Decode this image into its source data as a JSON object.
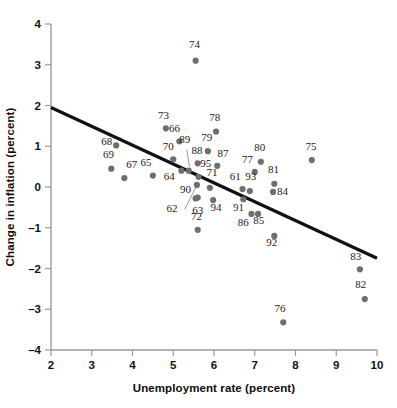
{
  "chart_data": {
    "type": "scatter",
    "title": "",
    "xlabel": "Unemployment rate (percent)",
    "ylabel": "Change in inflation (percent)",
    "xlim": [
      2,
      10
    ],
    "ylim": [
      -4,
      4
    ],
    "xticks": [
      "2",
      "3",
      "4",
      "5",
      "6",
      "7",
      "8",
      "9",
      "10"
    ],
    "yticks": [
      "4",
      "3",
      "2",
      "1",
      "0",
      "-1",
      "-2",
      "-3",
      "-4"
    ],
    "grid": false,
    "legend": null,
    "point_color": "#6e6e6e",
    "line_color": "#111111",
    "fit_line": {
      "label": "regression line",
      "x_start": 2.0,
      "y_start": 1.95,
      "x_end": 10.0,
      "y_end": -1.75
    },
    "points": [
      {
        "label": "61",
        "x": 6.7,
        "y": -0.05,
        "lx": 6.52,
        "ly": 0.18
      },
      {
        "label": "62",
        "x": 5.55,
        "y": -0.28,
        "lx": 4.97,
        "ly": -0.62
      },
      {
        "label": "63",
        "x": 5.6,
        "y": -0.26,
        "lx": 5.6,
        "ly": -0.66
      },
      {
        "label": "64",
        "x": 5.2,
        "y": 0.4,
        "lx": 4.9,
        "ly": 0.17
      },
      {
        "label": "65",
        "x": 4.5,
        "y": 0.28,
        "lx": 4.33,
        "ly": 0.52
      },
      {
        "label": "66",
        "x": 5.15,
        "y": 1.12,
        "lx": 5.03,
        "ly": 1.35
      },
      {
        "label": "67",
        "x": 3.8,
        "y": 0.22,
        "lx": 3.98,
        "ly": 0.46
      },
      {
        "label": "68",
        "x": 3.6,
        "y": 1.02,
        "lx": 3.37,
        "ly": 1.02
      },
      {
        "label": "69",
        "x": 3.48,
        "y": 0.45,
        "lx": 3.41,
        "ly": 0.7
      },
      {
        "label": "70",
        "x": 5.0,
        "y": 0.68,
        "lx": 4.88,
        "ly": 0.92
      },
      {
        "label": "71",
        "x": 5.9,
        "y": -0.02,
        "lx": 5.95,
        "ly": 0.26
      },
      {
        "label": "72",
        "x": 5.6,
        "y": -1.05,
        "lx": 5.57,
        "ly": -0.8
      },
      {
        "label": "73",
        "x": 4.82,
        "y": 1.44,
        "lx": 4.76,
        "ly": 1.68
      },
      {
        "label": "74",
        "x": 5.55,
        "y": 3.1,
        "lx": 5.52,
        "ly": 3.4
      },
      {
        "label": "75",
        "x": 8.4,
        "y": 0.66,
        "lx": 8.38,
        "ly": 0.9
      },
      {
        "label": "76",
        "x": 7.7,
        "y": -3.32,
        "lx": 7.62,
        "ly": -3.06
      },
      {
        "label": "77",
        "x": 7.0,
        "y": 0.37,
        "lx": 6.82,
        "ly": 0.6
      },
      {
        "label": "78",
        "x": 6.05,
        "y": 1.36,
        "lx": 6.02,
        "ly": 1.63
      },
      {
        "label": "79",
        "x": 5.85,
        "y": 0.88,
        "lx": 5.82,
        "ly": 1.12
      },
      {
        "label": "80",
        "x": 7.15,
        "y": 0.62,
        "lx": 7.12,
        "ly": 0.88
      },
      {
        "label": "81",
        "x": 7.48,
        "y": 0.08,
        "lx": 7.46,
        "ly": 0.35
      },
      {
        "label": "82",
        "x": 9.7,
        "y": -2.75,
        "lx": 9.6,
        "ly": -2.48
      },
      {
        "label": "83",
        "x": 9.58,
        "y": -2.02,
        "lx": 9.48,
        "ly": -1.78
      },
      {
        "label": "84",
        "x": 7.45,
        "y": -0.12,
        "lx": 7.68,
        "ly": -0.2
      },
      {
        "label": "85",
        "x": 7.08,
        "y": -0.66,
        "lx": 7.1,
        "ly": -0.92
      },
      {
        "label": "86",
        "x": 6.92,
        "y": -0.66,
        "lx": 6.72,
        "ly": -0.95
      },
      {
        "label": "87",
        "x": 6.08,
        "y": 0.52,
        "lx": 6.22,
        "ly": 0.74
      },
      {
        "label": "88",
        "x": 5.6,
        "y": 0.58,
        "lx": 5.58,
        "ly": 0.8
      },
      {
        "label": "89",
        "x": 5.38,
        "y": 0.4,
        "lx": 5.28,
        "ly": 1.07
      },
      {
        "label": "90",
        "x": 5.58,
        "y": 0.05,
        "lx": 5.3,
        "ly": -0.14
      },
      {
        "label": "91",
        "x": 6.72,
        "y": -0.3,
        "lx": 6.6,
        "ly": -0.58
      },
      {
        "label": "92",
        "x": 7.48,
        "y": -1.2,
        "lx": 7.42,
        "ly": -1.45
      },
      {
        "label": "93",
        "x": 6.88,
        "y": -0.1,
        "lx": 6.9,
        "ly": 0.18
      },
      {
        "label": "94",
        "x": 5.98,
        "y": -0.32,
        "lx": 6.05,
        "ly": -0.58
      },
      {
        "label": "95",
        "x": 5.62,
        "y": 0.25,
        "lx": 5.8,
        "ly": 0.48
      }
    ],
    "leader_lines": [
      {
        "from_label": "89",
        "x1": 5.33,
        "y1": 0.92,
        "x2": 5.4,
        "y2": 0.5
      },
      {
        "from_label": "62",
        "x1": 5.28,
        "y1": -0.55,
        "x2": 5.55,
        "y2": -0.02
      }
    ]
  }
}
